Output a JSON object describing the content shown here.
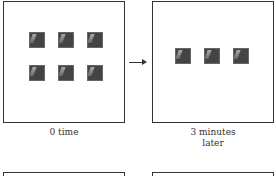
{
  "panels": [
    {
      "id": "p1",
      "caption": "0 time",
      "squares": 6,
      "layout": "2 rows x 3"
    },
    {
      "id": "p2",
      "caption_line1": "3  minutes",
      "caption_line2": "later",
      "squares": 3,
      "layout": "1 row x 3"
    }
  ],
  "arrow": {
    "direction": "right"
  },
  "colors": {
    "square": "#444444",
    "border": "#333333"
  }
}
